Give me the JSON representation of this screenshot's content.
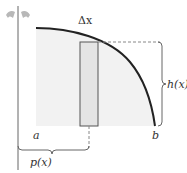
{
  "diagram": {
    "type": "shell-method-volume-of-revolution",
    "labels": {
      "delta_x": "Δx",
      "height": "h(x)",
      "radius": "p(x)",
      "a": "a",
      "b": "b"
    },
    "icons": {
      "rotation": "rotation-arrows-icon"
    },
    "colors": {
      "curve": "#222222",
      "region_fill": "#f2f2f2",
      "rect_fill": "#e4e4e4",
      "rect_stroke": "#555555",
      "axis": "#666666",
      "dashed": "#888888",
      "rotation_icon": "#b8b8b8",
      "text": "#333333"
    }
  }
}
